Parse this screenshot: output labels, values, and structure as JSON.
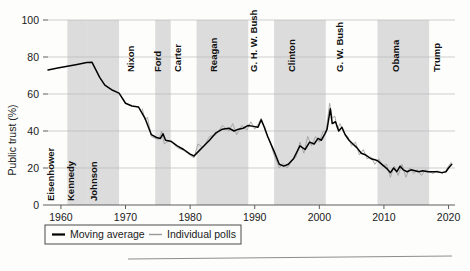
{
  "figure": {
    "name": "public-trust-in-government-chart",
    "background_color": "#fdfdfc"
  },
  "chart_data": {
    "type": "line",
    "title": "",
    "xlabel": "",
    "ylabel": "Public trust (%)",
    "xlim": [
      1958,
      2021
    ],
    "ylim": [
      0,
      100
    ],
    "grid": true,
    "legend_position": "below-axis-left",
    "x_ticks": [
      1960,
      1970,
      1980,
      1990,
      2000,
      2010,
      2020
    ],
    "x_tick_labels": [
      "1960",
      "1970",
      "1980",
      "1990",
      "2000",
      "2010",
      "2020"
    ],
    "y_ticks": [
      0,
      20,
      40,
      60,
      80,
      100
    ],
    "y_tick_labels": [
      "0",
      "20",
      "40",
      "60",
      "80",
      "100"
    ],
    "legend": [
      {
        "label": "Moving average",
        "color": "#000000",
        "style": "thick-line"
      },
      {
        "label": "Individual polls",
        "color": "#9a9a9a",
        "style": "thin-line"
      }
    ],
    "shaded_bands_color": "#dcdcdc",
    "president_terms": [
      {
        "name": "Eisenhower",
        "start": 1958.0,
        "end": 1961.0,
        "shaded": false,
        "label_x": 1959.0
      },
      {
        "name": "Kennedy",
        "start": 1961.0,
        "end": 1963.9,
        "shaded": true,
        "label_x": 1962.1
      },
      {
        "name": "Johnson",
        "start": 1963.9,
        "end": 1969.0,
        "shaded": true,
        "label_x": 1965.6
      },
      {
        "name": "Nixon",
        "start": 1969.0,
        "end": 1974.6,
        "shaded": false,
        "label_x": 1971.3
      },
      {
        "name": "Ford",
        "start": 1974.6,
        "end": 1977.0,
        "shaded": true,
        "label_x": 1975.5
      },
      {
        "name": "Carter",
        "start": 1977.0,
        "end": 1981.0,
        "shaded": false,
        "label_x": 1978.6
      },
      {
        "name": "Reagan",
        "start": 1981.0,
        "end": 1989.0,
        "shaded": true,
        "label_x": 1984.2
      },
      {
        "name": "G. H. W. Bush",
        "start": 1989.0,
        "end": 1993.0,
        "shaded": false,
        "label_x": 1990.4
      },
      {
        "name": "Clinton",
        "start": 1993.0,
        "end": 2001.0,
        "shaded": true,
        "label_x": 1996.2
      },
      {
        "name": "G. W. Bush",
        "start": 2001.0,
        "end": 2009.0,
        "shaded": false,
        "label_x": 2003.6
      },
      {
        "name": "Obama",
        "start": 2009.0,
        "end": 2017.0,
        "shaded": true,
        "label_x": 2012.3
      },
      {
        "name": "Trump",
        "start": 2017.0,
        "end": 2021.0,
        "shaded": false,
        "label_x": 2018.6
      }
    ],
    "series": [
      {
        "name": "Moving average",
        "color": "#000000",
        "points": [
          [
            1958.0,
            73.0
          ],
          [
            1959.5,
            74.0
          ],
          [
            1961.0,
            75.0
          ],
          [
            1962.5,
            76.0
          ],
          [
            1964.0,
            77.0
          ],
          [
            1964.8,
            77.2
          ],
          [
            1966.0,
            69.0
          ],
          [
            1966.8,
            64.8
          ],
          [
            1968.0,
            62.0
          ],
          [
            1969.0,
            60.5
          ],
          [
            1970.0,
            55.0
          ],
          [
            1971.0,
            53.5
          ],
          [
            1972.0,
            53.0
          ],
          [
            1973.0,
            47.0
          ],
          [
            1974.0,
            38.0
          ],
          [
            1974.8,
            36.5
          ],
          [
            1975.4,
            36.0
          ],
          [
            1975.8,
            38.5
          ],
          [
            1976.2,
            35.0
          ],
          [
            1977.0,
            34.5
          ],
          [
            1978.0,
            32.0
          ],
          [
            1979.0,
            30.0
          ],
          [
            1980.0,
            27.5
          ],
          [
            1980.6,
            26.5
          ],
          [
            1981.3,
            29.0
          ],
          [
            1982.0,
            31.5
          ],
          [
            1983.0,
            35.0
          ],
          [
            1984.0,
            39.0
          ],
          [
            1985.0,
            41.0
          ],
          [
            1986.0,
            41.5
          ],
          [
            1986.8,
            40.0
          ],
          [
            1987.5,
            41.0
          ],
          [
            1988.2,
            41.5
          ],
          [
            1989.0,
            43.0
          ],
          [
            1989.8,
            42.5
          ],
          [
            1990.5,
            42.0
          ],
          [
            1991.0,
            46.0
          ],
          [
            1991.5,
            42.0
          ],
          [
            1992.0,
            37.0
          ],
          [
            1993.0,
            29.0
          ],
          [
            1993.8,
            22.0
          ],
          [
            1994.5,
            21.0
          ],
          [
            1995.2,
            22.0
          ],
          [
            1996.0,
            25.0
          ],
          [
            1997.0,
            32.0
          ],
          [
            1997.8,
            30.0
          ],
          [
            1998.5,
            34.0
          ],
          [
            1999.2,
            33.0
          ],
          [
            1999.8,
            36.0
          ],
          [
            2000.3,
            35.0
          ],
          [
            2000.8,
            38.0
          ],
          [
            2001.2,
            41.0
          ],
          [
            2001.7,
            52.0
          ],
          [
            2002.0,
            44.0
          ],
          [
            2002.5,
            45.0
          ],
          [
            2003.0,
            40.0
          ],
          [
            2003.5,
            42.0
          ],
          [
            2004.0,
            38.0
          ],
          [
            2004.6,
            35.0
          ],
          [
            2005.2,
            33.0
          ],
          [
            2005.8,
            31.0
          ],
          [
            2006.5,
            28.0
          ],
          [
            2007.2,
            27.0
          ],
          [
            2008.0,
            25.0
          ],
          [
            2008.6,
            24.5
          ],
          [
            2009.0,
            24.0
          ],
          [
            2009.5,
            22.5
          ],
          [
            2010.0,
            21.0
          ],
          [
            2010.5,
            19.5
          ],
          [
            2011.0,
            17.5
          ],
          [
            2011.5,
            20.0
          ],
          [
            2012.0,
            18.0
          ],
          [
            2012.5,
            21.0
          ],
          [
            2013.0,
            19.0
          ],
          [
            2013.6,
            18.0
          ],
          [
            2014.2,
            19.0
          ],
          [
            2014.8,
            18.5
          ],
          [
            2015.4,
            18.0
          ],
          [
            2016.0,
            18.5
          ],
          [
            2016.8,
            18.0
          ],
          [
            2017.5,
            18.0
          ],
          [
            2018.2,
            18.0
          ],
          [
            2019.0,
            17.5
          ],
          [
            2019.6,
            18.0
          ],
          [
            2020.0,
            20.0
          ],
          [
            2020.5,
            22.0
          ]
        ]
      },
      {
        "name": "Individual polls",
        "color": "#9a9a9a",
        "points": [
          [
            1972.6,
            52.0
          ],
          [
            1973.0,
            46.0
          ],
          [
            1973.4,
            47.5
          ],
          [
            1974.0,
            37.0
          ],
          [
            1974.6,
            36.0
          ],
          [
            1975.2,
            35.5
          ],
          [
            1975.6,
            40.0
          ],
          [
            1976.0,
            33.0
          ],
          [
            1976.6,
            34.5
          ],
          [
            1977.2,
            34.0
          ],
          [
            1978.0,
            31.0
          ],
          [
            1979.0,
            29.5
          ],
          [
            1980.0,
            27.0
          ],
          [
            1980.6,
            25.5
          ],
          [
            1981.2,
            33.0
          ],
          [
            1982.0,
            31.0
          ],
          [
            1983.0,
            37.0
          ],
          [
            1984.0,
            38.0
          ],
          [
            1985.0,
            43.0
          ],
          [
            1986.0,
            40.0
          ],
          [
            1986.6,
            44.0
          ],
          [
            1987.2,
            38.0
          ],
          [
            1988.0,
            43.0
          ],
          [
            1988.8,
            40.5
          ],
          [
            1989.4,
            45.0
          ],
          [
            1990.0,
            41.0
          ],
          [
            1990.6,
            44.0
          ],
          [
            1991.0,
            47.0
          ],
          [
            1991.6,
            40.0
          ],
          [
            1992.2,
            36.0
          ],
          [
            1993.0,
            27.0
          ],
          [
            1993.8,
            20.0
          ],
          [
            1994.4,
            22.5
          ],
          [
            1995.0,
            20.0
          ],
          [
            1995.8,
            24.0
          ],
          [
            1996.4,
            26.0
          ],
          [
            1997.0,
            34.0
          ],
          [
            1997.6,
            28.0
          ],
          [
            1998.2,
            37.0
          ],
          [
            1998.8,
            32.0
          ],
          [
            1999.4,
            37.0
          ],
          [
            2000.0,
            34.0
          ],
          [
            2000.6,
            40.0
          ],
          [
            2001.0,
            39.0
          ],
          [
            2001.6,
            55.0
          ],
          [
            2002.0,
            47.0
          ],
          [
            2002.4,
            48.0
          ],
          [
            2002.8,
            41.0
          ],
          [
            2003.2,
            44.0
          ],
          [
            2003.8,
            39.0
          ],
          [
            2004.4,
            37.0
          ],
          [
            2005.0,
            32.0
          ],
          [
            2005.6,
            34.0
          ],
          [
            2006.2,
            27.0
          ],
          [
            2006.8,
            30.0
          ],
          [
            2007.4,
            25.0
          ],
          [
            2008.0,
            26.0
          ],
          [
            2008.6,
            22.0
          ],
          [
            2009.2,
            25.0
          ],
          [
            2009.8,
            21.0
          ],
          [
            2010.4,
            22.0
          ],
          [
            2011.0,
            15.0
          ],
          [
            2011.6,
            21.0
          ],
          [
            2012.2,
            16.0
          ],
          [
            2012.8,
            22.0
          ],
          [
            2013.4,
            15.0
          ],
          [
            2014.0,
            20.0
          ],
          [
            2014.6,
            17.0
          ],
          [
            2015.2,
            19.0
          ],
          [
            2015.8,
            16.0
          ],
          [
            2016.4,
            19.0
          ],
          [
            2017.0,
            18.0
          ],
          [
            2017.6,
            17.0
          ],
          [
            2018.2,
            18.5
          ],
          [
            2019.0,
            17.0
          ],
          [
            2019.6,
            18.5
          ],
          [
            2020.0,
            21.0
          ],
          [
            2020.4,
            23.0
          ]
        ]
      }
    ]
  }
}
